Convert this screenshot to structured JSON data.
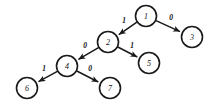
{
  "figure": {
    "type": "binary-decision-tree-diagram",
    "background_color": "#ffffff",
    "stroke_color": "#1a1a1a",
    "width": 214,
    "height": 105
  },
  "chart_data": {
    "type": "diagram",
    "title": "",
    "nodes": [
      {
        "id": "n1",
        "label": "1",
        "cx": 146,
        "cy": 16,
        "r": 10.5
      },
      {
        "id": "n3",
        "label": "3",
        "cx": 192,
        "cy": 37,
        "r": 10.5
      },
      {
        "id": "n2",
        "label": "2",
        "cx": 108,
        "cy": 42,
        "r": 10.5
      },
      {
        "id": "n5",
        "label": "5",
        "cx": 149,
        "cy": 63,
        "r": 10.5
      },
      {
        "id": "n4",
        "label": "4",
        "cx": 67,
        "cy": 66,
        "r": 10.5
      },
      {
        "id": "n6",
        "label": "6",
        "cx": 27,
        "cy": 88,
        "r": 10.5
      },
      {
        "id": "n7",
        "label": "7",
        "cx": 110,
        "cy": 88,
        "r": 10.5
      }
    ],
    "edges": [
      {
        "from": "n1",
        "to": "n2",
        "label": "1",
        "label_x": 124,
        "label_y": 20,
        "directed": true
      },
      {
        "from": "n1",
        "to": "n3",
        "label": "0",
        "label_x": 171,
        "label_y": 17,
        "directed": true
      },
      {
        "from": "n2",
        "to": "n4",
        "label": "0",
        "label_x": 85,
        "label_y": 45,
        "directed": true
      },
      {
        "from": "n2",
        "to": "n5",
        "label": "1",
        "label_x": 132,
        "label_y": 45,
        "directed": true
      },
      {
        "from": "n4",
        "to": "n6",
        "label": "1",
        "label_x": 44,
        "label_y": 68,
        "directed": true
      },
      {
        "from": "n4",
        "to": "n7",
        "label": "0",
        "label_x": 90,
        "label_y": 68,
        "directed": true
      }
    ]
  }
}
